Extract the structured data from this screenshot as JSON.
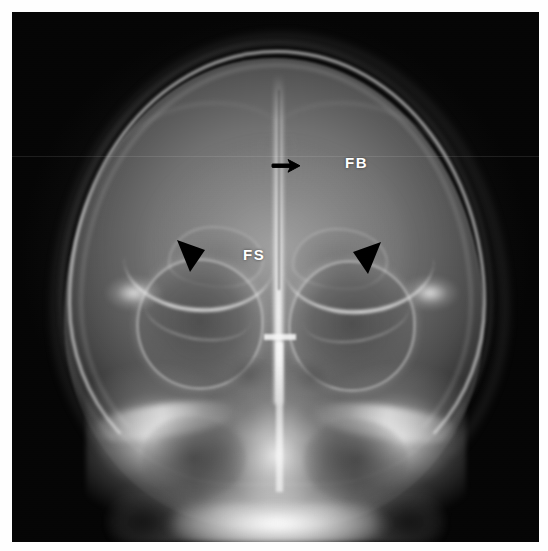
{
  "figure": {
    "modality": "radiograph",
    "view": "Caldwell (posteroanterior) skull projection",
    "background_color": "#ffffff",
    "film_color": "#050505",
    "annotation_color": "#000000",
    "label_color": "#ffffff"
  },
  "labels": [
    {
      "id": "fb",
      "text": "FB",
      "meaning": "frontal bone",
      "x": 345,
      "y": 155
    },
    {
      "id": "fs",
      "text": "FS",
      "meaning": "frontal sinus",
      "x": 243,
      "y": 247
    }
  ],
  "markers": [
    {
      "id": "midline-arrow",
      "glyph": "arrow",
      "direction": "right",
      "x": 258,
      "y": 140,
      "points_to": "midline metopic / sagittal suture stripe"
    },
    {
      "id": "arrowhead-left",
      "glyph": "arrowhead",
      "direction": "down-right",
      "x": 158,
      "y": 222,
      "points_to": "left superior orbital rim / frontal sinus margin"
    },
    {
      "id": "arrowhead-right",
      "glyph": "arrowhead",
      "direction": "down-left",
      "x": 336,
      "y": 224,
      "points_to": "right superior orbital rim / frontal sinus margin"
    }
  ],
  "anatomy": {
    "regions": [
      "cranial vault",
      "frontal bone",
      "frontal sinus",
      "orbits",
      "ethmoid air cells",
      "nasal septum",
      "crista galli",
      "maxillary antra",
      "petrous ridges",
      "alveolar ridge"
    ]
  }
}
